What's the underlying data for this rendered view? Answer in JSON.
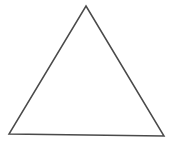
{
  "canvas": {
    "width": 173,
    "height": 144,
    "background_color": "#ffffff",
    "border": "none"
  },
  "figure": {
    "name": "triangle",
    "type": "polygon",
    "fill": "none",
    "stroke_color": "#4a4a4a",
    "stroke_width": 1.5,
    "vertex_count": 3,
    "vertices": [
      {
        "label": "apex",
        "x": 86,
        "y": 6
      },
      {
        "label": "bottom-right",
        "x": 164,
        "y": 136
      },
      {
        "label": "bottom-left",
        "x": 9,
        "y": 134
      }
    ],
    "points_attr": "86,6 164,136 9,134"
  },
  "labels": {
    "text_present": false,
    "items": []
  }
}
